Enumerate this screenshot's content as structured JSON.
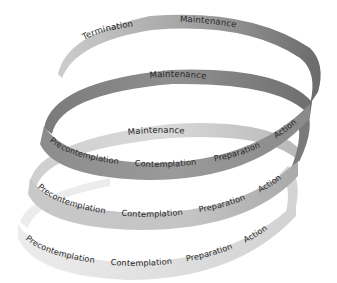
{
  "diagram": {
    "type": "spiral-stages-of-change",
    "colors": {
      "loop_top": "#9c9c9c",
      "loop_top_dark": "#6e6e6e",
      "loop_top_light": "#c4c4c4",
      "loop_2": "#8a8a8a",
      "loop_2_dark": "#6a6a6a",
      "loop_3": "#c8c8c8",
      "loop_3_light": "#dedede",
      "loop_4": "#e0e0e0",
      "text": "#2a2a2a"
    },
    "loops": [
      {
        "name": "loop-1-top",
        "labels": {
          "termination": "Termination",
          "maintenance": "Maintenance"
        }
      },
      {
        "name": "loop-2",
        "labels": {
          "maintenance": "Maintenance",
          "precontemplation": "Precontemplation",
          "contemplation": "Contemplation",
          "preparation": "Preparation",
          "action": "Action"
        }
      },
      {
        "name": "loop-3",
        "labels": {
          "maintenance": "Maintenance",
          "precontemplation": "Precontemplation",
          "contemplation": "Contemplation",
          "preparation": "Preparation",
          "action": "Action"
        }
      },
      {
        "name": "loop-4-bottom",
        "labels": {
          "precontemplation": "Precontemplation",
          "contemplation": "Contemplation",
          "preparation": "Preparation",
          "action": "Action"
        }
      }
    ]
  }
}
